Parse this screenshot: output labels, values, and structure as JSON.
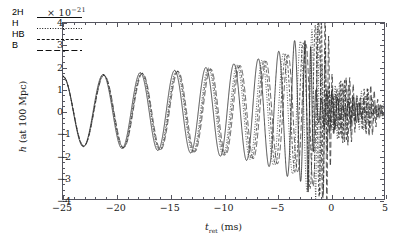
{
  "chart_data": {
    "type": "line",
    "title": "",
    "xlabel": "t_ret (ms)",
    "ylabel": "h (at 100 Mpc)",
    "y_exponent_label": "× 10",
    "y_exponent_power": "−21",
    "xlim": [
      -25,
      5
    ],
    "ylim": [
      -4,
      4
    ],
    "xticks": [
      -25,
      -20,
      -15,
      -10,
      -5,
      0,
      5
    ],
    "xtick_labels": [
      "−25",
      "−20",
      "−15",
      "−10",
      "−5",
      "0",
      "5"
    ],
    "x_minor_step": 1,
    "yticks": [
      -4,
      -3,
      -2,
      -1,
      0,
      1,
      2,
      3,
      4
    ],
    "ytick_labels": [
      "−4",
      "−3",
      "−2",
      "−1",
      "0",
      "1",
      "2",
      "3",
      "4"
    ],
    "y_minor_step": 0.25,
    "grid": false,
    "legend_position": "upper-left",
    "series": [
      {
        "name": "2H",
        "linestyle": "solid",
        "color": "#111111",
        "merger_time": -2.2,
        "inspiral_amplitude": 1.6,
        "peak_amplitude": 3.2,
        "ringdown_decay": 2.6,
        "postmerger_frequency": 2.0
      },
      {
        "name": "H",
        "linestyle": "dotted",
        "color": "#1b1b1b",
        "merger_time": -1.4,
        "inspiral_amplitude": 1.6,
        "peak_amplitude": 3.7,
        "ringdown_decay": 3.0,
        "postmerger_frequency": 2.45
      },
      {
        "name": "HB",
        "linestyle": "dashed",
        "color": "#202020",
        "merger_time": -1.0,
        "inspiral_amplitude": 1.6,
        "peak_amplitude": 3.9,
        "ringdown_decay": 3.2,
        "postmerger_frequency": 2.75
      },
      {
        "name": "B",
        "linestyle": "longdash",
        "color": "#242424",
        "merger_time": -0.6,
        "inspiral_amplitude": 1.6,
        "peak_amplitude": 4.0,
        "ringdown_decay": 3.4,
        "postmerger_frequency": 3.05
      }
    ]
  },
  "axes": {
    "x_title_symbol": "t",
    "x_title_sub": "ret",
    "x_title_unit": "(ms)",
    "y_title_symbol": "h",
    "y_title_unit": "(at 100 Mpc)"
  },
  "legend": {
    "entries": [
      {
        "label": "2H",
        "style": "solid"
      },
      {
        "label": "H",
        "style": "dotted"
      },
      {
        "label": "HB",
        "style": "dashed"
      },
      {
        "label": "B",
        "style": "longdash"
      }
    ]
  },
  "colors": {
    "axis": "#55555f",
    "curve": "#111111",
    "background": "#ffffff"
  }
}
